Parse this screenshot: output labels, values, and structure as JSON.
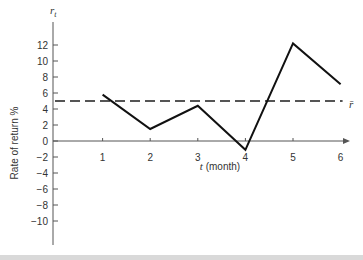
{
  "chart_data": {
    "type": "line",
    "title": "",
    "xlabel_var": "t",
    "xlabel_rest": " (month)",
    "ylabel": "Rate of return %",
    "yaxis_symbol": "r",
    "yaxis_symbol_sub": "t",
    "x": [
      1,
      2,
      3,
      4,
      5,
      6
    ],
    "series": [
      {
        "name": "r_t",
        "values": [
          5.8,
          1.5,
          4.4,
          -1.1,
          12.2,
          7.1
        ],
        "style": "solid",
        "color": "#111111"
      },
      {
        "name": "r̄",
        "values": [
          5.0,
          5.0
        ],
        "x": [
          0,
          6
        ],
        "style": "dashed",
        "color": "#555555"
      }
    ],
    "mean_label": "r̄",
    "xticks": [
      "1",
      "2",
      "3",
      "4",
      "5",
      "6"
    ],
    "yticks": [
      "12",
      "10",
      "8",
      "6",
      "4",
      "2",
      "0",
      "−2",
      "−4",
      "−6",
      "−8",
      "−10"
    ],
    "ytick_values": [
      12,
      10,
      8,
      6,
      4,
      2,
      0,
      -2,
      -4,
      -6,
      -8,
      -10
    ],
    "xlim": [
      0,
      6.05
    ],
    "ylim": [
      -13,
      15
    ],
    "grid": false,
    "legend": "none"
  }
}
